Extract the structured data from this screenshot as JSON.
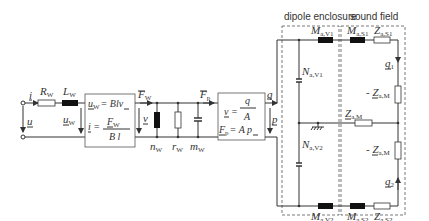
{
  "headers": {
    "dipole_enclosure": "dipole enclosure",
    "sound_field": "sound field"
  },
  "input": {
    "current": "i",
    "voltage": "u"
  },
  "electrical": {
    "R": "R",
    "R_sub": "W",
    "L": "L",
    "L_sub": "W",
    "uw": "u",
    "uw_sub": "W"
  },
  "transducer1": {
    "eq1_lhs": "u",
    "eq1_sub": "W",
    "eq1_rhs": "= Blv",
    "eq2_lhs": "i =",
    "eq2_num": "F",
    "eq2_num_sub": "W",
    "eq2_den": "B l"
  },
  "mechanical": {
    "F": "F",
    "F_sub": "W",
    "v": "v",
    "n": "n",
    "n_sub": "W",
    "r": "r",
    "r_sub": "W",
    "m": "m",
    "m_sub": "W",
    "Fp": "F",
    "Fp_sub": "p"
  },
  "transducer2": {
    "eq1_lhs": "v =",
    "eq1_num": "q",
    "eq1_den": "A",
    "eq2_lhs": "F",
    "eq2_sub": "p",
    "eq2_rhs": "= A p"
  },
  "acoustic": {
    "q": "q",
    "p": "p",
    "MaV1": "M",
    "MaV1_sub": "a,V1",
    "NaV1": "N",
    "NaV1_sub": "a,V1",
    "NaV2": "N",
    "NaV2_sub": "a,V2",
    "MaV2": "M",
    "MaV2_sub": "a,V2",
    "MaS1": "M",
    "MaS1_sub": "a,S1",
    "ZaS1": "Z",
    "ZaS1_sub": "a,S1",
    "MaS2": "M",
    "MaS2_sub": "a,S2",
    "ZaS2": "Z",
    "ZaS2_sub": "a,S2",
    "ZaM": "Z",
    "ZaM_sub": "a,M",
    "negZaM1": "- Z",
    "negZaM1_sub": "a,M",
    "negZaM2": "- Z",
    "negZaM2_sub": "a,M",
    "q1": "q",
    "q1_sub": "1",
    "q2": "q",
    "q2_sub": "2"
  }
}
